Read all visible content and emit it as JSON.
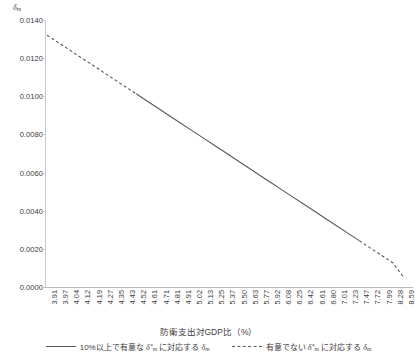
{
  "chart_data": {
    "type": "line",
    "title": "",
    "xlabel": "防衛支出対GDP比（%）",
    "ylabel": "δm",
    "ylim": [
      0.0,
      0.014
    ],
    "xlim_index": [
      0,
      42
    ],
    "grid": false,
    "legend_position": "bottom",
    "ytick_labels": [
      "0.0140",
      "0.0120",
      "0.0100",
      "0.0080",
      "0.0060",
      "0.0040",
      "0.0020",
      "0.0000"
    ],
    "ytick_values": [
      0.014,
      0.012,
      0.01,
      0.008,
      0.006,
      0.004,
      0.002,
      0.0
    ],
    "categories": [
      "3.91",
      "3.97",
      "4.04",
      "4.12",
      "4.19",
      "4.27",
      "4.35",
      "4.43",
      "4.52",
      "4.61",
      "4.71",
      "4.81",
      "4.91",
      "5.02",
      "5.13",
      "5.25",
      "5.37",
      "5.50",
      "5.63",
      "5.77",
      "5.92",
      "6.08",
      "6.25",
      "6.42",
      "6.61",
      "6.80",
      "7.01",
      "7.23",
      "7.47",
      "7.72",
      "7.99",
      "8.28",
      "8.59"
    ],
    "values": [
      0.0132,
      0.01282,
      0.01244,
      0.01205,
      0.01167,
      0.01128,
      0.0109,
      0.01051,
      0.01013,
      0.00974,
      0.00936,
      0.00897,
      0.00859,
      0.0082,
      0.00782,
      0.00743,
      0.00705,
      0.00666,
      0.00628,
      0.00589,
      0.00551,
      0.00512,
      0.00474,
      0.00435,
      0.00397,
      0.00358,
      0.0032,
      0.00281,
      0.00243,
      0.00204,
      0.00166,
      0.00127,
      0.0005
    ],
    "series": [
      {
        "name": "有意でない δ*m に対応する δm",
        "style": "dashed",
        "segments": [
          [
            0,
            8
          ],
          [
            28,
            32
          ]
        ]
      },
      {
        "name": "10%以上で有意な δ*m に対応する δm",
        "style": "solid",
        "segments": [
          [
            8,
            28
          ]
        ]
      }
    ],
    "line_color": "#595959"
  },
  "legend": {
    "items": [
      {
        "style": "solid",
        "prefix": "10%以上で有意な ",
        "symbol": "δ",
        "symbol_sub": "m",
        "symbol_star": "*",
        "middle": " に対応する ",
        "symbol2": "δ",
        "symbol2_sub": "m",
        "full": "10%以上で有意なδ*mに対応するδm"
      },
      {
        "style": "dashed",
        "prefix": "有意でない ",
        "symbol": "δ",
        "symbol_sub": "m",
        "symbol_star": "*",
        "middle": " に対応する ",
        "symbol2": "δ",
        "symbol2_sub": "m",
        "full": "有意でないδ*mに対応するδm"
      }
    ]
  },
  "axes": {
    "y_label_main": "δ",
    "y_label_sub": "m",
    "x_title": "防衛支出対GDP比（%）"
  }
}
